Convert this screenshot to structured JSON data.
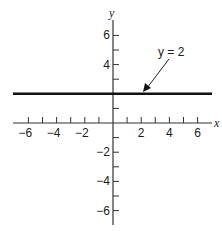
{
  "chart_data": {
    "type": "line",
    "title": "",
    "xlabel": "x",
    "ylabel": "y",
    "xlim": [
      -7,
      7
    ],
    "ylim": [
      -7,
      7
    ],
    "grid": false,
    "x_ticks": [
      -6,
      -5,
      -4,
      -3,
      -2,
      -1,
      1,
      2,
      3,
      4,
      5,
      6
    ],
    "x_tick_labels": [
      "−6",
      "−4",
      "−2",
      "2",
      "4",
      "6"
    ],
    "x_tick_label_values": [
      -6,
      -4,
      -2,
      2,
      4,
      6
    ],
    "y_ticks": [
      -6,
      -5,
      -4,
      -3,
      -2,
      -1,
      1,
      2,
      3,
      4,
      5,
      6
    ],
    "y_tick_labels": [
      "6",
      "4",
      "−2",
      "−4",
      "−6"
    ],
    "y_tick_label_values": [
      6,
      4,
      -2,
      -4,
      -6
    ],
    "series": [
      {
        "name": "y = 2",
        "x": [
          -7,
          7
        ],
        "values": [
          2,
          2
        ]
      }
    ],
    "annotations": [
      {
        "text": "y = 2",
        "arrow_to": [
          1.8,
          2
        ]
      }
    ]
  },
  "labels": {
    "x_axis": "x",
    "y_axis": "y",
    "equation": "y = 2"
  }
}
